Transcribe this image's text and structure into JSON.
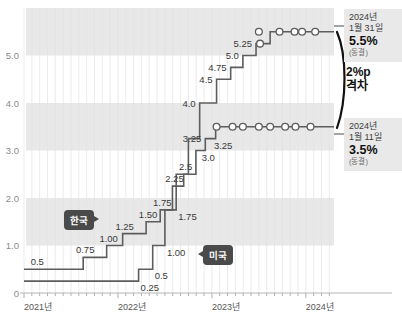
{
  "chart_data": {
    "type": "line",
    "title": "",
    "xlabel": "",
    "ylabel": "",
    "ylim": [
      0,
      6.0
    ],
    "xlim": [
      "2021",
      "2024.3"
    ],
    "grid": true,
    "legend_position": "inline",
    "y_ticks": [
      "5.0",
      "4.0",
      "3.0",
      "2.0",
      "1.0",
      "0"
    ],
    "y_tick_values": [
      5.0,
      4.0,
      3.0,
      2.0,
      1.0,
      0
    ],
    "x_ticks": [
      "2021년",
      "2022년",
      "2023년",
      "2024년"
    ],
    "x_tick_values": [
      2021.0,
      2022.0,
      2023.0,
      2024.0
    ],
    "shaded_bands": [
      [
        1.0,
        2.0
      ],
      [
        3.0,
        4.0
      ],
      [
        5.0,
        6.0
      ]
    ],
    "series": [
      {
        "name": "한국",
        "color": "#5d5d5d",
        "steps": [
          {
            "x": 2021.0,
            "y": 0.5
          },
          {
            "x": 2021.63,
            "y": 0.75
          },
          {
            "x": 2021.88,
            "y": 1.0
          },
          {
            "x": 2022.05,
            "y": 1.25
          },
          {
            "x": 2022.3,
            "y": 1.5
          },
          {
            "x": 2022.45,
            "y": 1.75
          },
          {
            "x": 2022.58,
            "y": 2.25
          },
          {
            "x": 2022.7,
            "y": 2.5
          },
          {
            "x": 2022.83,
            "y": 3.0
          },
          {
            "x": 2022.93,
            "y": 3.25
          },
          {
            "x": 2023.04,
            "y": 3.5
          }
        ],
        "labels": [
          {
            "text": "0.5",
            "x": 2021.12,
            "y": 0.5,
            "pos": "above"
          },
          {
            "text": "0.75",
            "x": 2021.63,
            "y": 0.75,
            "pos": "above"
          },
          {
            "text": "1.00",
            "x": 2021.88,
            "y": 1.0,
            "pos": "above"
          },
          {
            "text": "1.25",
            "x": 2022.05,
            "y": 1.25,
            "pos": "above"
          },
          {
            "text": "1.50",
            "x": 2022.3,
            "y": 1.5,
            "pos": "above"
          },
          {
            "text": "1.75",
            "x": 2022.45,
            "y": 1.75,
            "pos": "above"
          },
          {
            "text": "2.25",
            "x": 2022.58,
            "y": 2.25,
            "pos": "above"
          },
          {
            "text": "2.5",
            "x": 2022.7,
            "y": 2.5,
            "pos": "above"
          },
          {
            "text": "3.25",
            "x": 2022.93,
            "y": 3.25,
            "pos": "left"
          }
        ],
        "markers_from": 2023.04,
        "marker_x": [
          2023.05,
          2023.22,
          2023.33,
          2023.5,
          2023.62,
          2023.78,
          2023.89,
          2024.05
        ],
        "marker_y": 3.5,
        "final_value": 3.5
      },
      {
        "name": "미국",
        "color": "#5d5d5d",
        "steps": [
          {
            "x": 2021.0,
            "y": 0.25
          },
          {
            "x": 2022.22,
            "y": 0.5
          },
          {
            "x": 2022.37,
            "y": 1.0
          },
          {
            "x": 2022.5,
            "y": 1.75
          },
          {
            "x": 2022.62,
            "y": 2.5
          },
          {
            "x": 2022.75,
            "y": 3.25
          },
          {
            "x": 2022.87,
            "y": 4.0
          },
          {
            "x": 2023.05,
            "y": 4.5
          },
          {
            "x": 2023.2,
            "y": 4.75
          },
          {
            "x": 2023.33,
            "y": 5.0
          },
          {
            "x": 2023.47,
            "y": 5.25
          },
          {
            "x": 2023.62,
            "y": 5.5
          }
        ],
        "labels": [
          {
            "text": "0.25",
            "x": 2022.22,
            "y": 0.25,
            "pos": "below"
          },
          {
            "text": "0.5",
            "x": 2022.37,
            "y": 0.5,
            "pos": "below"
          },
          {
            "text": "1.00",
            "x": 2022.5,
            "y": 1.0,
            "pos": "below"
          },
          {
            "text": "1.75",
            "x": 2022.62,
            "y": 1.75,
            "pos": "below"
          },
          {
            "text": "3.0",
            "x": 2022.87,
            "y": 3.0,
            "pos": "below"
          },
          {
            "text": "3.25",
            "x": 2023.0,
            "y": 3.25,
            "pos": "below"
          },
          {
            "text": "4.0",
            "x": 2022.87,
            "y": 4.0,
            "pos": "left"
          },
          {
            "text": "4.5",
            "x": 2023.05,
            "y": 4.5,
            "pos": "left"
          },
          {
            "text": "4.75",
            "x": 2023.2,
            "y": 4.75,
            "pos": "left"
          },
          {
            "text": "5.0",
            "x": 2023.33,
            "y": 5.0,
            "pos": "left"
          },
          {
            "text": "5.25",
            "x": 2023.47,
            "y": 5.25,
            "pos": "left"
          }
        ],
        "marker_x": [
          2023.5,
          2023.72,
          2023.88,
          2023.96,
          2024.1
        ],
        "marker_y_extra": 5.5,
        "final_value": 5.5
      }
    ]
  },
  "annotations": {
    "usa_callout": {
      "year": "2024년",
      "date": "1월 31일",
      "value": "5.5%",
      "note": "(동결)"
    },
    "korea_callout": {
      "year": "2024년",
      "date": "1월 11일",
      "value": "3.5%",
      "note": "(동결)"
    },
    "gap": {
      "line1": "2%p",
      "line2": "격차"
    }
  },
  "legend": {
    "korea": "한국",
    "usa": "미국"
  },
  "axis": {
    "y_labels": [
      "5.0",
      "4.0",
      "3.0",
      "2.0",
      "1.0",
      "0"
    ],
    "x_labels": [
      "2021년",
      "2022년",
      "2023년",
      "2024년"
    ]
  },
  "colors": {
    "band": "#e8e8e8",
    "line": "#5d5d5d",
    "pill": "#4a4a4a",
    "callout_bg": "#e9e9e9",
    "text": "#2b2b2b"
  }
}
